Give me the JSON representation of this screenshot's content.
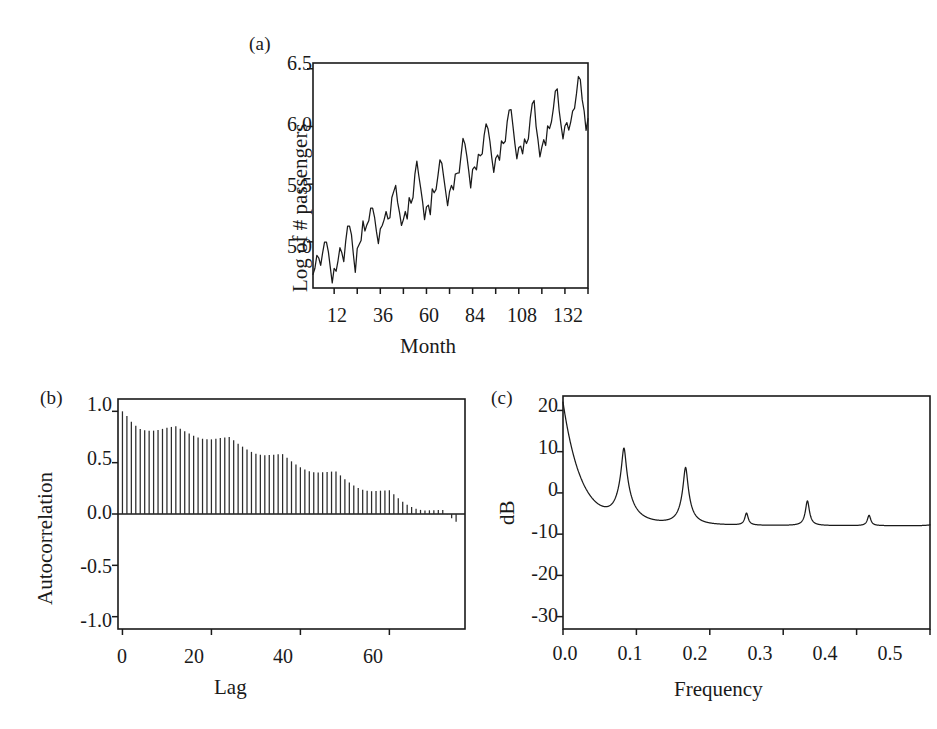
{
  "figure": {
    "background": "#ffffff",
    "ink": "#1a1a1a"
  },
  "panels": {
    "a": {
      "label": "(a)",
      "xlabel": "Month",
      "ylabel": "Log of # passengers",
      "xticklabels": [
        "12",
        "36",
        "60",
        "84",
        "108",
        "132"
      ],
      "yticklabels": [
        "5.0",
        "5.5",
        "6.0",
        "6.5"
      ]
    },
    "b": {
      "label": "(b)",
      "xlabel": "Lag",
      "ylabel": "Autocorrelation",
      "xticklabels": [
        "0",
        "20",
        "40",
        "60"
      ],
      "yticklabels": [
        "-1.0",
        "-0.5",
        "0.0",
        "0.5",
        "1.0"
      ]
    },
    "c": {
      "label": "(c)",
      "xlabel": "Frequency",
      "ylabel": "dB",
      "xticklabels": [
        "0.0",
        "0.1",
        "0.2",
        "0.3",
        "0.4",
        "0.5"
      ],
      "yticklabels": [
        "-30",
        "-20",
        "-10",
        "0",
        "10",
        "20"
      ]
    }
  },
  "chart_data": [
    {
      "type": "line",
      "panel": "a",
      "title": "(a)",
      "xlabel": "Month",
      "ylabel": "Log of # passengers",
      "xlim": [
        1,
        144
      ],
      "ylim": [
        4.6,
        6.55
      ],
      "xticks": [
        12,
        24,
        36,
        48,
        60,
        72,
        84,
        96,
        108,
        120,
        132,
        144
      ],
      "xticklabels": [
        "12",
        "",
        "36",
        "",
        "60",
        "",
        "84",
        "",
        "108",
        "",
        "132",
        ""
      ],
      "yticks": [
        5.0,
        5.5,
        6.0,
        6.5
      ],
      "grid": false,
      "legend": null,
      "x": [
        1,
        2,
        3,
        4,
        5,
        6,
        7,
        8,
        9,
        10,
        11,
        12,
        13,
        14,
        15,
        16,
        17,
        18,
        19,
        20,
        21,
        22,
        23,
        24,
        25,
        26,
        27,
        28,
        29,
        30,
        31,
        32,
        33,
        34,
        35,
        36,
        37,
        38,
        39,
        40,
        41,
        42,
        43,
        44,
        45,
        46,
        47,
        48,
        49,
        50,
        51,
        52,
        53,
        54,
        55,
        56,
        57,
        58,
        59,
        60,
        61,
        62,
        63,
        64,
        65,
        66,
        67,
        68,
        69,
        70,
        71,
        72,
        73,
        74,
        75,
        76,
        77,
        78,
        79,
        80,
        81,
        82,
        83,
        84,
        85,
        86,
        87,
        88,
        89,
        90,
        91,
        92,
        93,
        94,
        95,
        96,
        97,
        98,
        99,
        100,
        101,
        102,
        103,
        104,
        105,
        106,
        107,
        108,
        109,
        110,
        111,
        112,
        113,
        114,
        115,
        116,
        117,
        118,
        119,
        120,
        121,
        122,
        123,
        124,
        125,
        126,
        127,
        128,
        129,
        130,
        131,
        132,
        133,
        134,
        135,
        136,
        137,
        138,
        139,
        140,
        141,
        142,
        143,
        144
      ],
      "values": [
        4.718,
        4.771,
        4.883,
        4.86,
        4.796,
        4.905,
        4.997,
        4.997,
        4.913,
        4.779,
        4.644,
        4.771,
        4.745,
        4.836,
        4.949,
        4.905,
        4.828,
        5.004,
        5.136,
        5.136,
        5.063,
        4.89,
        4.736,
        4.942,
        4.977,
        5.011,
        5.182,
        5.094,
        5.147,
        5.182,
        5.293,
        5.293,
        5.215,
        5.088,
        4.984,
        5.112,
        5.142,
        5.193,
        5.263,
        5.198,
        5.209,
        5.384,
        5.438,
        5.489,
        5.342,
        5.253,
        5.142,
        5.193,
        5.263,
        5.198,
        5.384,
        5.335,
        5.384,
        5.587,
        5.7,
        5.575,
        5.465,
        5.347,
        5.193,
        5.303,
        5.318,
        5.236,
        5.46,
        5.425,
        5.455,
        5.576,
        5.71,
        5.68,
        5.557,
        5.434,
        5.313,
        5.434,
        5.489,
        5.451,
        5.587,
        5.595,
        5.598,
        5.752,
        5.897,
        5.849,
        5.743,
        5.613,
        5.468,
        5.628,
        5.649,
        5.624,
        5.759,
        5.746,
        5.762,
        5.924,
        6.023,
        5.981,
        5.872,
        5.724,
        5.602,
        5.724,
        5.753,
        5.707,
        5.875,
        5.852,
        5.872,
        6.045,
        6.142,
        6.146,
        6.001,
        5.849,
        5.72,
        5.817,
        5.829,
        5.762,
        5.892,
        5.852,
        5.894,
        6.075,
        6.196,
        6.225,
        6.001,
        5.883,
        5.737,
        5.82,
        5.886,
        5.835,
        6.006,
        5.981,
        6.041,
        6.157,
        6.306,
        6.326,
        6.138,
        6.009,
        5.892,
        6.004,
        6.033,
        5.969,
        6.038,
        6.133,
        6.157,
        6.282,
        6.433,
        6.407,
        6.23,
        6.134,
        5.966,
        6.068
      ]
    },
    {
      "type": "bar",
      "panel": "b",
      "title": "(b)",
      "xlabel": "Lag",
      "ylabel": "Autocorrelation",
      "xlim": [
        -1,
        77
      ],
      "ylim": [
        -1.12,
        1.12
      ],
      "xticks": [
        0,
        20,
        40,
        60
      ],
      "yticks": [
        -1.0,
        -0.5,
        0.0,
        0.5,
        1.0
      ],
      "grid": false,
      "legend": null,
      "lags": [
        0,
        1,
        2,
        3,
        4,
        5,
        6,
        7,
        8,
        9,
        10,
        11,
        12,
        13,
        14,
        15,
        16,
        17,
        18,
        19,
        20,
        21,
        22,
        23,
        24,
        25,
        26,
        27,
        28,
        29,
        30,
        31,
        32,
        33,
        34,
        35,
        36,
        37,
        38,
        39,
        40,
        41,
        42,
        43,
        44,
        45,
        46,
        47,
        48,
        49,
        50,
        51,
        52,
        53,
        54,
        55,
        56,
        57,
        58,
        59,
        60,
        61,
        62,
        63,
        64,
        65,
        66,
        67,
        68,
        69,
        70,
        71,
        72,
        73,
        74,
        75
      ],
      "values": [
        1.0,
        0.954,
        0.899,
        0.859,
        0.828,
        0.815,
        0.812,
        0.812,
        0.818,
        0.829,
        0.84,
        0.848,
        0.854,
        0.831,
        0.805,
        0.784,
        0.761,
        0.744,
        0.733,
        0.728,
        0.727,
        0.732,
        0.74,
        0.745,
        0.75,
        0.718,
        0.685,
        0.656,
        0.628,
        0.605,
        0.587,
        0.576,
        0.572,
        0.574,
        0.578,
        0.581,
        0.583,
        0.548,
        0.513,
        0.483,
        0.455,
        0.433,
        0.416,
        0.406,
        0.403,
        0.406,
        0.41,
        0.413,
        0.415,
        0.376,
        0.338,
        0.306,
        0.277,
        0.254,
        0.237,
        0.226,
        0.222,
        0.224,
        0.227,
        0.23,
        0.232,
        0.192,
        0.153,
        0.12,
        0.091,
        0.068,
        0.051,
        0.04,
        0.035,
        0.036,
        0.037,
        0.038,
        0.038,
        -0.003,
        -0.042,
        -0.075
      ]
    },
    {
      "type": "line",
      "panel": "c",
      "title": "(c)",
      "xlabel": "Frequency",
      "ylabel": "dB",
      "xlim": [
        0.0,
        0.5
      ],
      "ylim": [
        -33,
        23.5
      ],
      "xticks": [
        0.0,
        0.1,
        0.2,
        0.3,
        0.4,
        0.5
      ],
      "yticks": [
        -30,
        -20,
        -10,
        0,
        10,
        20
      ],
      "grid": false,
      "legend": null,
      "description": "Power spectral density of log airline passengers, showing a strong low-frequency trend component and sharp harmonic peaks at multiples of 1/12 cycles per month.",
      "peaks": [
        {
          "frequency": 0.0,
          "dB": 22.0
        },
        {
          "frequency": 0.083,
          "dB": 10.8
        },
        {
          "frequency": 0.167,
          "dB": 6.0
        },
        {
          "frequency": 0.25,
          "dB": -8.0
        },
        {
          "frequency": 0.333,
          "dB": -3.2
        },
        {
          "frequency": 0.417,
          "dB": -9.0
        }
      ],
      "troughs": [
        {
          "frequency": 0.055,
          "dB": -15.3
        },
        {
          "frequency": 0.133,
          "dB": -23.5
        },
        {
          "frequency": 0.212,
          "dB": -26.8
        },
        {
          "frequency": 0.295,
          "dB": -30.0
        },
        {
          "frequency": 0.378,
          "dB": -31.2
        },
        {
          "frequency": 0.462,
          "dB": -31.0
        }
      ],
      "endpoint": {
        "frequency": 0.5,
        "dB": -20.5
      }
    }
  ]
}
